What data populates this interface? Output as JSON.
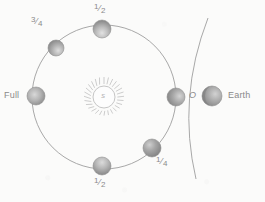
{
  "figure": {
    "background_color": "#fbfbfa",
    "ink_color": "#9a9a9a",
    "sphere_color": "#a8a8a8"
  },
  "sun": {
    "label": "S",
    "center": {
      "x": 104,
      "y": 97
    },
    "core_radius": 11,
    "ray_count": 28,
    "ray_length": 7,
    "color": "#b5b5b5"
  },
  "orbit": {
    "center": {
      "x": 104,
      "y": 97
    },
    "radius": 72,
    "stroke": "#9e9e9e",
    "stroke_width": 0.9
  },
  "earth_arc": {
    "start": {
      "x": 208,
      "y": 18
    },
    "control": {
      "x": 178,
      "y": 98
    },
    "end": {
      "x": 196,
      "y": 179
    },
    "stroke": "#9e9e9e",
    "stroke_width": 0.9
  },
  "moons": [
    {
      "id": "moon-new",
      "label": "O",
      "label_style": "italic",
      "angle_deg": 0,
      "center": {
        "x": 176,
        "y": 97
      },
      "radius": 9,
      "label_pos": {
        "x": 190,
        "y": 92
      },
      "shading": "lit-right"
    },
    {
      "id": "moon-top-half",
      "label": "1/2",
      "label_numerator": "1",
      "label_denominator": "2",
      "angle_deg": 90,
      "center": {
        "x": 102,
        "y": 29
      },
      "radius": 9,
      "label_pos": {
        "x": 95,
        "y": 3
      },
      "shading": "lit-bottom"
    },
    {
      "id": "moon-three-quarter",
      "label": "3/4",
      "label_numerator": "3",
      "label_denominator": "4",
      "angle_deg": 132,
      "center": {
        "x": 56,
        "y": 48
      },
      "radius": 8,
      "label_pos": {
        "x": 33,
        "y": 19
      },
      "shading": "lit-bottom-right"
    },
    {
      "id": "moon-full",
      "label": "Full",
      "angle_deg": 180,
      "center": {
        "x": 36,
        "y": 96
      },
      "radius": 9,
      "label_pos": {
        "x": 5,
        "y": 92
      },
      "shading": "lit-center"
    },
    {
      "id": "moon-bottom-half",
      "label": "1/2",
      "label_numerator": "1",
      "label_denominator": "2",
      "angle_deg": 268,
      "center": {
        "x": 102,
        "y": 166
      },
      "radius": 9,
      "label_pos": {
        "x": 95,
        "y": 175
      },
      "shading": "lit-top"
    },
    {
      "id": "moon-quarter",
      "label": "1/4",
      "label_numerator": "1",
      "label_denominator": "4",
      "angle_deg": 310,
      "center": {
        "x": 152,
        "y": 148
      },
      "radius": 9,
      "label_pos": {
        "x": 156,
        "y": 158
      },
      "shading": "lit-top-left"
    }
  ],
  "earth": {
    "label": "Earth",
    "center": {
      "x": 212,
      "y": 96
    },
    "radius": 10,
    "label_pos": {
      "x": 227,
      "y": 91
    },
    "shading": "lit-right-dark-left"
  }
}
